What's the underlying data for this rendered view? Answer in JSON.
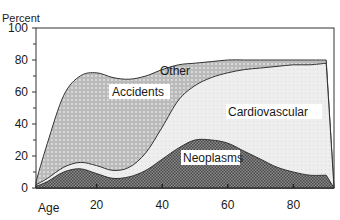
{
  "chart_data": {
    "type": "area",
    "title": "",
    "xlabel": "Age",
    "ylabel": "Percent",
    "xlim": [
      0,
      90
    ],
    "ylim": [
      0,
      100
    ],
    "x_ticks": [
      20,
      40,
      60,
      80
    ],
    "y_ticks": [
      0,
      20,
      40,
      60,
      80,
      100
    ],
    "grid": false,
    "legend_position": "inline labels",
    "stacked": true,
    "x": [
      1,
      5,
      10,
      15,
      20,
      25,
      30,
      35,
      40,
      45,
      50,
      55,
      60,
      65,
      70,
      75,
      80,
      85,
      90
    ],
    "series": [
      {
        "name": "Neoplasms",
        "label_fill": "dark crosshatch",
        "values": [
          1,
          4,
          10,
          12,
          9,
          6,
          7,
          11,
          18,
          25,
          30,
          30,
          28,
          23,
          18,
          13,
          10,
          8,
          8
        ]
      },
      {
        "name": "Cardiovascular",
        "label_fill": "light stipple",
        "values": [
          2,
          6,
          13,
          16,
          14,
          11,
          13,
          22,
          38,
          55,
          64,
          69,
          72,
          74,
          75,
          76,
          77,
          77,
          78
        ]
      },
      {
        "name": "Accidents",
        "label_fill": "dotted circles",
        "values": [
          4,
          28,
          58,
          70,
          72,
          69,
          68,
          70,
          74,
          77,
          78,
          79,
          80,
          80,
          80,
          80,
          80,
          80,
          80
        ]
      },
      {
        "name": "Other",
        "label_fill": "white",
        "values": [
          100,
          100,
          100,
          100,
          100,
          100,
          100,
          100,
          100,
          100,
          100,
          100,
          100,
          100,
          100,
          100,
          100,
          100,
          100
        ]
      }
    ],
    "note": "Series values are cumulative upper boundaries (percent of deaths by age)."
  },
  "labels": {
    "ylabel": "Percent",
    "xlabel": "Age",
    "other": "Other",
    "accidents": "Accidents",
    "cardiovascular": "Cardiovascular",
    "neoplasms": "Neoplasms"
  },
  "colors": {
    "neoplasms": "#6e6e6e",
    "cardiovascular": "#ececec",
    "accidents": "#bdbdbd",
    "other": "#ffffff",
    "axis": "#222222"
  }
}
